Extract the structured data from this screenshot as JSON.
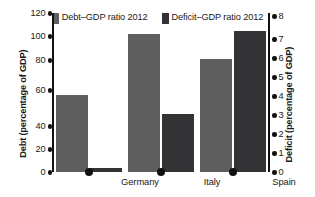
{
  "legend": {
    "entries": [
      {
        "label": "Debt–GDP ratio 2012",
        "swatch_name": "legend-swatch-debt",
        "color": "#5f5f60"
      },
      {
        "label": "Deficit–GDP ratio 2012",
        "swatch_name": "legend-swatch-deficit",
        "color": "#333335"
      }
    ]
  },
  "axes": {
    "left": {
      "title": "Debt (percentage of GDP)",
      "ticks": [
        "0",
        "20",
        "40",
        "60",
        "80",
        "100",
        "120"
      ],
      "min": 0,
      "max": 120
    },
    "right": {
      "title": "Deficit (percentage of GDP)",
      "ticks": [
        "0",
        "1",
        "2",
        "3",
        "4",
        "5",
        "6",
        "7",
        "8"
      ],
      "min": 0,
      "max": 8
    }
  },
  "categories": [
    "Germany",
    "Italy",
    "Spain"
  ],
  "chart_data": {
    "type": "bar",
    "title": "",
    "xlabel": "",
    "ylabel": "Debt (percentage of GDP)",
    "ylabel_secondary": "Deficit (percentage of GDP)",
    "categories": [
      "Germany",
      "Italy",
      "Spain"
    ],
    "series": [
      {
        "name": "Debt–GDP ratio 2012",
        "axis": "left",
        "color": "#5f5f60",
        "values": [
          58,
          104,
          85
        ]
      },
      {
        "name": "Deficit–GDP ratio 2012",
        "axis": "right",
        "color": "#333335",
        "values": [
          0.2,
          2.9,
          7.1
        ]
      }
    ],
    "ylim": [
      0,
      120
    ],
    "ylim_secondary": [
      0,
      8
    ],
    "yticks": [
      0,
      20,
      40,
      60,
      80,
      100,
      120
    ],
    "yticks_secondary": [
      0,
      1,
      2,
      3,
      4,
      5,
      6,
      7,
      8
    ],
    "grid": false,
    "legend_position": "top"
  }
}
